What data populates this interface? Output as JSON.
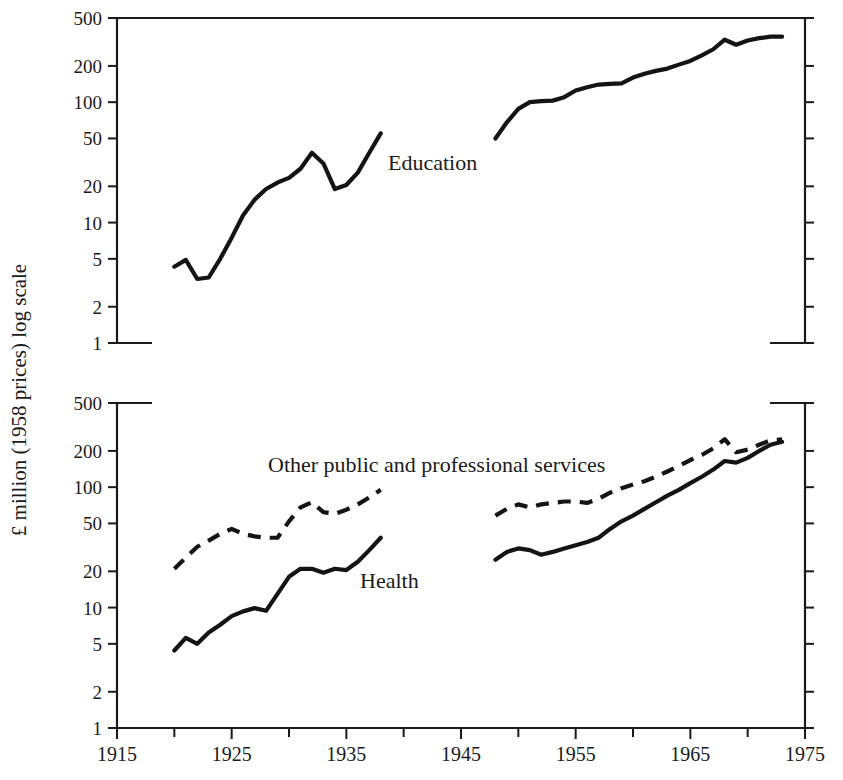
{
  "figure": {
    "y_axis_title": "£ million (1958 prices) log scale",
    "background_color": "#ffffff",
    "line_color": "#141414"
  },
  "labels": {
    "education": "Education",
    "other_public": "Other public and professional services",
    "health": "Health"
  },
  "axis": {
    "y_tick_labels": [
      "500",
      "200",
      "100",
      "50",
      "20",
      "10",
      "5",
      "2",
      "1"
    ],
    "x_tick_labels": [
      "1915",
      "1925",
      "1935",
      "1945",
      "1955",
      "1965",
      "1975"
    ]
  },
  "chart_data": [
    {
      "type": "line",
      "panel": "top",
      "title": "",
      "xlabel": "",
      "ylabel": "£ million (1958 prices) log scale",
      "xlim": [
        1915,
        1975
      ],
      "ylim": [
        1,
        500
      ],
      "yscale": "log",
      "grid": false,
      "legend": "inline-annotation",
      "y_ticks": [
        1,
        2,
        5,
        10,
        20,
        50,
        100,
        200,
        500
      ],
      "x_ticks": [
        1915,
        1920,
        1925,
        1930,
        1935,
        1940,
        1945,
        1950,
        1955,
        1960,
        1965,
        1970,
        1975
      ],
      "x_tick_labels_shown": [
        1915,
        1925,
        1935,
        1945,
        1955,
        1965,
        1975
      ],
      "series": [
        {
          "name": "Education",
          "style": "solid",
          "annotation": "Education",
          "segments": [
            {
              "x": [
                1920,
                1921,
                1922,
                1923,
                1924,
                1925,
                1926,
                1927,
                1928,
                1929,
                1930,
                1931,
                1932,
                1933,
                1934,
                1935,
                1936,
                1937,
                1938
              ],
              "y": [
                4.3,
                4.9,
                3.4,
                3.5,
                5.0,
                7.5,
                11.5,
                15.5,
                19.0,
                21.5,
                23.5,
                28.0,
                38.0,
                31.0,
                19.0,
                20.5,
                26.0,
                38.0,
                55.0
              ]
            },
            {
              "x": [
                1948,
                1949,
                1950,
                1951,
                1952,
                1953,
                1954,
                1955,
                1956,
                1957,
                1958,
                1959,
                1960,
                1961,
                1962,
                1963,
                1964,
                1965,
                1966,
                1967,
                1968,
                1969,
                1970,
                1971,
                1972,
                1973
              ],
              "y": [
                50.0,
                68.0,
                88.0,
                100.0,
                102.0,
                103.0,
                110.0,
                125.0,
                133.0,
                140.0,
                142.0,
                143.0,
                160.0,
                172.0,
                182.0,
                190.0,
                205.0,
                220.0,
                245.0,
                275.0,
                330.0,
                300.0,
                325.0,
                340.0,
                350.0,
                350.0
              ]
            }
          ]
        }
      ]
    },
    {
      "type": "line",
      "panel": "bottom",
      "title": "",
      "xlabel": "",
      "ylabel": "£ million (1958 prices) log scale",
      "xlim": [
        1915,
        1975
      ],
      "ylim": [
        1,
        500
      ],
      "yscale": "log",
      "grid": false,
      "legend": "inline-annotation",
      "y_ticks": [
        1,
        2,
        5,
        10,
        20,
        50,
        100,
        200,
        500
      ],
      "x_ticks": [
        1915,
        1920,
        1925,
        1930,
        1935,
        1940,
        1945,
        1950,
        1955,
        1960,
        1965,
        1970,
        1975
      ],
      "x_tick_labels_shown": [
        1915,
        1925,
        1935,
        1945,
        1955,
        1965,
        1975
      ],
      "series": [
        {
          "name": "Other public and professional services",
          "style": "dashed",
          "annotation": "Other public and professional services",
          "segments": [
            {
              "x": [
                1920,
                1921,
                1922,
                1923,
                1924,
                1925,
                1926,
                1927,
                1928,
                1929,
                1930,
                1931,
                1932,
                1933,
                1934,
                1935,
                1936,
                1937,
                1938
              ],
              "y": [
                21.0,
                26.0,
                32.0,
                36.0,
                41.0,
                45.0,
                41.0,
                39.0,
                38.0,
                38.0,
                52.0,
                68.0,
                75.0,
                62.0,
                60.0,
                65.0,
                72.0,
                82.0,
                95.0
              ]
            },
            {
              "x": [
                1948,
                1949,
                1950,
                1951,
                1952,
                1953,
                1954,
                1955,
                1956,
                1957,
                1958,
                1959,
                1960,
                1961,
                1962,
                1963,
                1964,
                1965,
                1966,
                1967,
                1968,
                1969,
                1970,
                1971,
                1972,
                1973
              ],
              "y": [
                58.0,
                66.0,
                72.0,
                68.0,
                72.0,
                74.0,
                76.0,
                76.0,
                74.0,
                80.0,
                90.0,
                98.0,
                105.0,
                112.0,
                122.0,
                135.0,
                150.0,
                168.0,
                185.0,
                210.0,
                250.0,
                195.0,
                205.0,
                225.0,
                245.0,
                250.0
              ]
            }
          ]
        },
        {
          "name": "Health",
          "style": "solid",
          "annotation": "Health",
          "segments": [
            {
              "x": [
                1920,
                1921,
                1922,
                1923,
                1924,
                1925,
                1926,
                1927,
                1928,
                1929,
                1930,
                1931,
                1932,
                1933,
                1934,
                1935,
                1936,
                1937,
                1938
              ],
              "y": [
                4.4,
                5.6,
                5.0,
                6.2,
                7.2,
                8.5,
                9.3,
                9.9,
                9.4,
                13.0,
                18.0,
                21.0,
                21.0,
                19.5,
                21.0,
                20.5,
                24.0,
                30.0,
                38.0
              ]
            },
            {
              "x": [
                1948,
                1949,
                1950,
                1951,
                1952,
                1953,
                1954,
                1955,
                1956,
                1957,
                1958,
                1959,
                1960,
                1961,
                1962,
                1963,
                1964,
                1965,
                1966,
                1967,
                1968,
                1969,
                1970,
                1971,
                1972,
                1973
              ],
              "y": [
                25.0,
                29.0,
                31.0,
                30.0,
                27.5,
                29.0,
                31.0,
                33.0,
                35.0,
                38.0,
                45.0,
                52.0,
                58.0,
                66.0,
                75.0,
                85.0,
                95.0,
                108.0,
                122.0,
                140.0,
                165.0,
                160.0,
                175.0,
                200.0,
                225.0,
                238.0
              ]
            }
          ]
        }
      ]
    }
  ]
}
